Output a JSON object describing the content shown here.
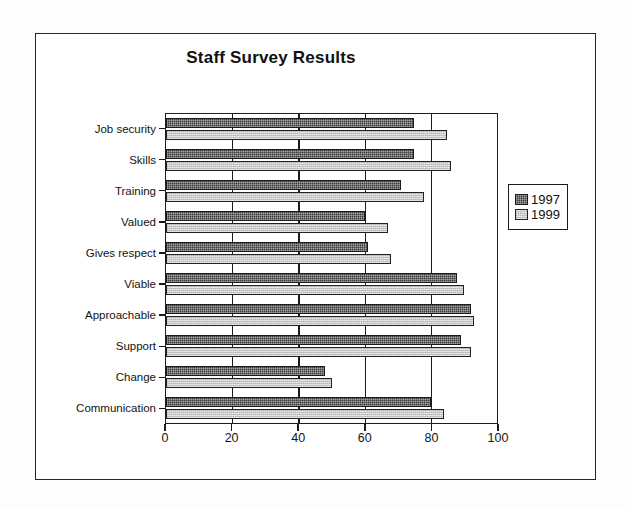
{
  "chart_data": {
    "type": "bar",
    "orientation": "horizontal",
    "title": "Staff Survey Results",
    "xlabel": "",
    "ylabel": "",
    "xlim": [
      0,
      100
    ],
    "xticks": [
      0,
      20,
      40,
      60,
      80,
      100
    ],
    "grid": true,
    "legend_position": "right",
    "categories": [
      "Job security",
      "Skills",
      "Training",
      "Valued",
      "Gives respect",
      "Viable",
      "Approachable",
      "Support",
      "Change",
      "Communication"
    ],
    "series": [
      {
        "name": "1997",
        "color": "#3a3a3a",
        "values": [
          75,
          75,
          71,
          60,
          61,
          88,
          92,
          89,
          48,
          80
        ]
      },
      {
        "name": "1999",
        "color": "#c9c9c9",
        "values": [
          85,
          86,
          78,
          67,
          68,
          90,
          93,
          92,
          50,
          84
        ]
      }
    ]
  },
  "legend": {
    "items": [
      {
        "label": "1997"
      },
      {
        "label": "1999"
      }
    ]
  }
}
